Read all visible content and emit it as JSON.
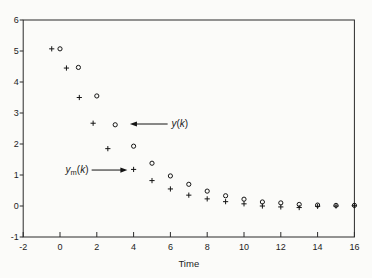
{
  "figure": {
    "background": "#fbfbf9",
    "frame_color": "#2b2b2b",
    "marker_color": "#141414",
    "text_color": "#1c1c1c"
  },
  "chart_data": {
    "type": "scatter",
    "title": "",
    "xlabel": "Time",
    "ylabel": "",
    "xlim": [
      -2,
      16
    ],
    "ylim": [
      -1,
      6
    ],
    "x_ticks": [
      -2,
      0,
      2,
      4,
      6,
      8,
      10,
      12,
      14,
      16
    ],
    "y_ticks": [
      -1,
      0,
      1,
      2,
      3,
      4,
      5,
      6
    ],
    "grid": false,
    "frame": true,
    "legend": "none (arrow annotations label the series)",
    "series": [
      {
        "name": "y(k)",
        "marker": "circle",
        "points": [
          [
            0,
            5.07
          ],
          [
            1,
            4.47
          ],
          [
            2,
            3.55
          ],
          [
            3,
            2.62
          ],
          [
            4,
            1.93
          ],
          [
            5,
            1.38
          ],
          [
            6,
            0.97
          ],
          [
            7,
            0.7
          ],
          [
            8,
            0.48
          ],
          [
            9,
            0.33
          ],
          [
            10,
            0.22
          ],
          [
            11,
            0.13
          ],
          [
            12,
            0.1
          ],
          [
            13,
            0.05
          ],
          [
            14,
            0.03
          ],
          [
            15,
            0.02
          ],
          [
            16,
            0.02
          ]
        ]
      },
      {
        "name": "ym(k)",
        "marker": "plus",
        "points": [
          [
            -0.45,
            5.07
          ],
          [
            0.35,
            4.45
          ],
          [
            1.05,
            3.5
          ],
          [
            1.8,
            2.67
          ],
          [
            2.6,
            1.85
          ],
          [
            4,
            1.18
          ],
          [
            5,
            0.82
          ],
          [
            6,
            0.55
          ],
          [
            7,
            0.35
          ],
          [
            8,
            0.23
          ],
          [
            9,
            0.14
          ],
          [
            10,
            0.07
          ],
          [
            11,
            0.0
          ],
          [
            12,
            -0.03
          ],
          [
            13,
            -0.05
          ],
          [
            14,
            -0.01
          ],
          [
            15,
            0.0
          ],
          [
            16,
            0.01
          ]
        ]
      }
    ],
    "annotations": [
      {
        "name": "label-y-of-k",
        "text": "y(k)",
        "parts": [
          {
            "t": "y",
            "i": 1
          },
          {
            "t": "(",
            "i": 0
          },
          {
            "t": "k",
            "i": 1
          },
          {
            "t": ")",
            "i": 0
          }
        ],
        "anchor": "start",
        "label_x": 6.06,
        "label_y": 2.66,
        "arrow": {
          "x1": 5.85,
          "y1": 2.645,
          "x2": 3.8,
          "y2": 2.645
        }
      },
      {
        "name": "label-ym-of-k",
        "text": "ym(k)",
        "parts": [
          {
            "t": "y",
            "i": 1
          },
          {
            "t": "m",
            "sub": 1
          },
          {
            "t": "(",
            "i": 0
          },
          {
            "t": "k",
            "i": 1
          },
          {
            "t": ")",
            "i": 0
          }
        ],
        "anchor": "end",
        "label_x": 1.55,
        "label_y": 1.18,
        "arrow": {
          "x1": 1.72,
          "y1": 1.16,
          "x2": 3.66,
          "y2": 1.16
        }
      }
    ]
  }
}
